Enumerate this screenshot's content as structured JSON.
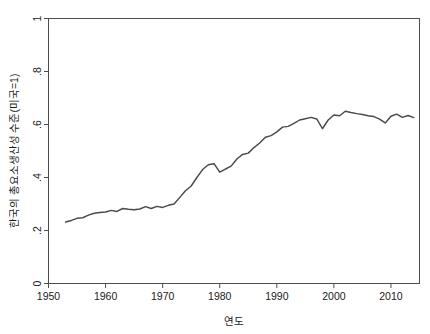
{
  "chart_data": {
    "type": "line",
    "title": "",
    "subtitle": "",
    "xlabel": "연도",
    "ylabel": "한국의 총요소생산성 수준(미국=1)",
    "xlim": [
      1950,
      2015
    ],
    "ylim": [
      0,
      1
    ],
    "grid": false,
    "legend": null,
    "legend_position": "none",
    "xticks": [
      1950,
      1960,
      1970,
      1980,
      1990,
      2000,
      2010
    ],
    "xticklabels": [
      "1950",
      "1960",
      "1970",
      "1980",
      "1990",
      "2000",
      "2010"
    ],
    "yticks": [
      0,
      0.2,
      0.4,
      0.6,
      0.8,
      1
    ],
    "yticklabels": [
      "0",
      ".2",
      ".4",
      ".6",
      ".8",
      "1"
    ],
    "line_color": "#4a4a4a",
    "axis_color": "#4d4d4d",
    "background_color": "#ffffff",
    "x": [
      1953,
      1954,
      1955,
      1956,
      1957,
      1958,
      1959,
      1960,
      1961,
      1962,
      1963,
      1964,
      1965,
      1966,
      1967,
      1968,
      1969,
      1970,
      1971,
      1972,
      1973,
      1974,
      1975,
      1976,
      1977,
      1978,
      1979,
      1980,
      1981,
      1982,
      1983,
      1984,
      1985,
      1986,
      1987,
      1988,
      1989,
      1990,
      1991,
      1992,
      1993,
      1994,
      1995,
      1996,
      1997,
      1998,
      1999,
      2000,
      2001,
      2002,
      2003,
      2004,
      2005,
      2006,
      2007,
      2008,
      2009,
      2010,
      2011,
      2012,
      2013,
      2014
    ],
    "values": [
      0.232,
      0.238,
      0.246,
      0.248,
      0.258,
      0.265,
      0.268,
      0.27,
      0.276,
      0.272,
      0.283,
      0.28,
      0.278,
      0.281,
      0.29,
      0.283,
      0.291,
      0.287,
      0.295,
      0.3,
      0.325,
      0.35,
      0.368,
      0.4,
      0.43,
      0.448,
      0.452,
      0.42,
      0.432,
      0.443,
      0.47,
      0.487,
      0.492,
      0.513,
      0.53,
      0.552,
      0.558,
      0.572,
      0.59,
      0.593,
      0.604,
      0.617,
      0.622,
      0.627,
      0.621,
      0.584,
      0.617,
      0.636,
      0.633,
      0.65,
      0.645,
      0.641,
      0.638,
      0.633,
      0.63,
      0.62,
      0.606,
      0.631,
      0.639,
      0.627,
      0.634,
      0.626
    ]
  }
}
